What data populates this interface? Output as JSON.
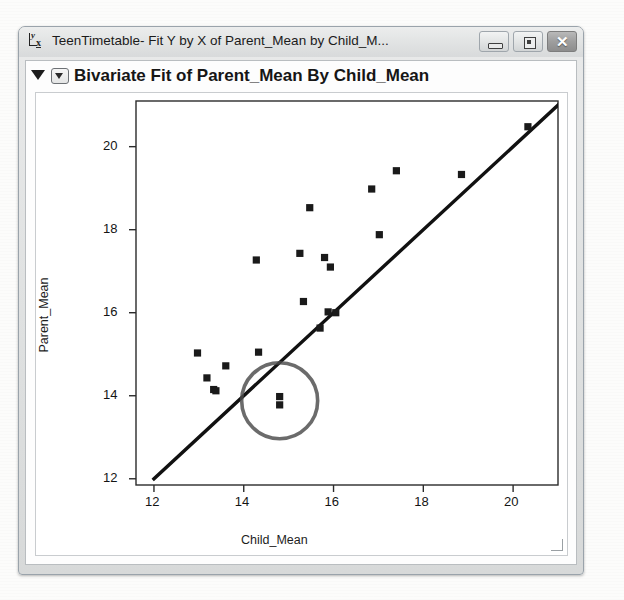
{
  "window": {
    "title": "TeenTimetable- Fit Y by X of Parent_Mean by Child_M...",
    "icon": "jmp-fit-y-by-x-icon",
    "controls": {
      "minimize_label": "–",
      "maximize_label": "□",
      "close_label": "✕"
    }
  },
  "report": {
    "title": "Bivariate Fit of Parent_Mean By Child_Mean",
    "outline_triangle": "disclosure-triangle-open",
    "section_triangle": "section-disclosure-open"
  },
  "background_bleed": {
    "top_left": "",
    "top_mid": "",
    "watermark": "Buxza"
  },
  "chart_data": {
    "type": "scatter",
    "title": "Bivariate Fit of Parent_Mean By Child_Mean",
    "xlabel": "Child_Mean",
    "ylabel": "Parent_Mean",
    "xlim": [
      11.6,
      21.0
    ],
    "ylim": [
      11.85,
      21.1
    ],
    "xticks": [
      12,
      14,
      16,
      18,
      20
    ],
    "yticks": [
      12,
      14,
      16,
      18,
      20
    ],
    "grid": false,
    "legend": null,
    "points": [
      {
        "x": 12.97,
        "y": 15.03
      },
      {
        "x": 13.18,
        "y": 14.43
      },
      {
        "x": 13.33,
        "y": 14.15
      },
      {
        "x": 13.38,
        "y": 14.12
      },
      {
        "x": 13.6,
        "y": 14.72
      },
      {
        "x": 14.28,
        "y": 17.27
      },
      {
        "x": 14.33,
        "y": 15.05
      },
      {
        "x": 14.8,
        "y": 13.98
      },
      {
        "x": 14.8,
        "y": 13.78
      },
      {
        "x": 15.25,
        "y": 17.43
      },
      {
        "x": 15.33,
        "y": 16.27
      },
      {
        "x": 15.47,
        "y": 18.53
      },
      {
        "x": 15.7,
        "y": 15.63
      },
      {
        "x": 15.8,
        "y": 17.33
      },
      {
        "x": 15.88,
        "y": 16.02
      },
      {
        "x": 15.93,
        "y": 17.1
      },
      {
        "x": 16.05,
        "y": 16.0
      },
      {
        "x": 16.85,
        "y": 18.98
      },
      {
        "x": 17.02,
        "y": 17.88
      },
      {
        "x": 17.4,
        "y": 19.42
      },
      {
        "x": 18.85,
        "y": 19.33
      },
      {
        "x": 20.33,
        "y": 20.48
      }
    ],
    "fit_line": {
      "name": "fit-line",
      "x0": 12.0,
      "y0": 12.0,
      "x1": 21.0,
      "y1": 21.0
    },
    "annotations": [
      {
        "name": "highlight-circle",
        "shape": "circle",
        "cx": 14.8,
        "cy": 13.88,
        "r_px": 38,
        "color": "#4a4a4a"
      }
    ],
    "colors": {
      "marker": "#1a1a1a",
      "fit_line": "#111111",
      "axis": "#2b2b2b",
      "plot_background": "#ffffff",
      "highlight": "#4a4a4a"
    }
  }
}
